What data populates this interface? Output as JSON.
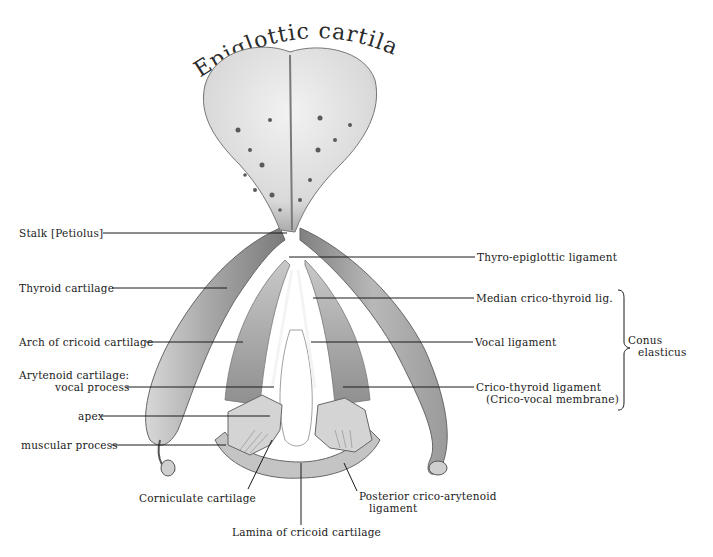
{
  "title": "Epiglottic cartilage",
  "labels_left": {
    "stalk": "Stalk [Petiolus]",
    "thyroid": "Thyroid cartilage",
    "arch": "Arch of cricoid cartilage",
    "arytenoid_line1": "Arytenoid cartilage:",
    "arytenoid_line2": "vocal process",
    "apex": "apex",
    "muscular": "muscular process"
  },
  "labels_right": {
    "thyro_epiglottic": "Thyro-epiglottic ligament",
    "median_crico_thyroid": "Median crico-thyroid lig.",
    "vocal_ligament": "Vocal ligament",
    "crico_thyroid_line1": "Crico-thyroid ligament",
    "crico_thyroid_line2": "(Crico-vocal membrane)",
    "conus_line1": "Conus",
    "conus_line2": "elasticus"
  },
  "labels_bottom": {
    "corniculate": "Corniculate cartilage",
    "posterior_line1": "Posterior crico-arytenoid",
    "posterior_line2": "ligament",
    "lamina": "Lamina of cricoid cartilage"
  },
  "colors": {
    "ink": "#1a1a1a",
    "cartilage_light": "#e6e6e6",
    "cartilage_mid": "#b5b5b5",
    "cartilage_dark": "#6e6e6e"
  }
}
